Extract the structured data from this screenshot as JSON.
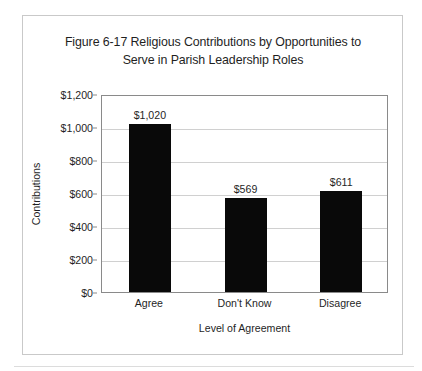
{
  "chart_data": {
    "type": "bar",
    "title": "Figure 6-17 Religious Contributions by Opportunities to Serve in Parish Leadership Roles",
    "title_lines": [
      "Figure 6-17 Religious Contributions by Opportunities to",
      "Serve in Parish Leadership Roles"
    ],
    "categories": [
      "Agree",
      "Don't Know",
      "Disagree"
    ],
    "values": [
      1020,
      569,
      611
    ],
    "data_labels": [
      "$1,020",
      "$569",
      "$611"
    ],
    "xlabel": "Level of Agreement",
    "ylabel": "Contributions",
    "ylim": [
      0,
      1200
    ],
    "ytick_values": [
      0,
      200,
      400,
      600,
      800,
      1000,
      1200
    ],
    "ytick_labels": [
      "$0",
      "$200",
      "$400",
      "$600",
      "$800",
      "$1,000",
      "$1,200"
    ],
    "grid": true,
    "legend": false,
    "bar_color": "#090909",
    "plot_border_color": "#8a8a8a",
    "gridline_color": "#d0d0d0"
  }
}
